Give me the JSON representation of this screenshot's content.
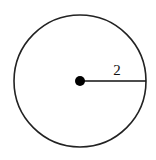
{
  "diagram": {
    "type": "circle-with-radius",
    "radius_label": "2",
    "circle": {
      "cx": 80,
      "cy": 81,
      "r": 66,
      "stroke": "#222222"
    },
    "center_dot": {
      "cx": 80,
      "cy": 81,
      "r": 5,
      "fill": "#000000"
    },
    "radius_line": {
      "x1": 80,
      "y1": 81,
      "x2": 146,
      "y2": 81
    }
  }
}
